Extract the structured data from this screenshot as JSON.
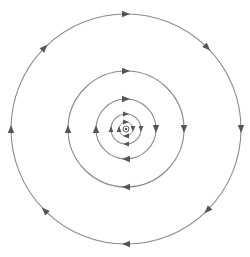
{
  "diagram": {
    "type": "magnetic-field-lines",
    "center": {
      "x": 126,
      "y": 129
    },
    "line_color": "#8a8a8a",
    "arrow_color": "#555555",
    "direction": "clockwise",
    "center_symbol": "current-out-of-page-icon",
    "rings": [
      {
        "radius": 115,
        "arrows": 8
      },
      {
        "radius": 58,
        "arrows": 4
      },
      {
        "radius": 30,
        "arrows": 4
      },
      {
        "radius": 15,
        "arrows": 4
      },
      {
        "radius": 7,
        "arrows": 4
      }
    ]
  }
}
